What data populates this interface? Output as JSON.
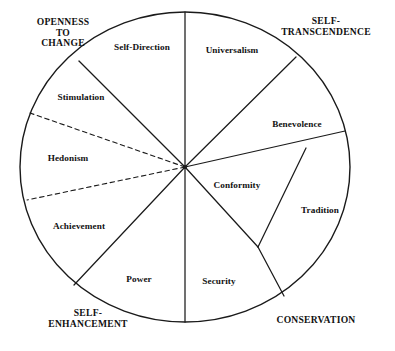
{
  "figure": {
    "background_color": "#ffffff",
    "line_color": "#1a1a1a",
    "text_color": "#111111"
  },
  "circle": {
    "cx": 185,
    "cy": 167,
    "rx": 165,
    "ry": 155,
    "stroke_width": 1.4,
    "fill": "#ffffff"
  },
  "chart_data": {
    "type": "pie",
    "title": "",
    "legend_position": "none",
    "grid": false,
    "note": "Schwartz circumplex of ten basic human values; wedge sizes read off the divider spokes of the circle. Hedonism is bounded by dashed spokes because it straddles two higher-order dimensions.",
    "categories": [
      "Self-Direction",
      "Universalism",
      "Benevolence",
      "Conformity",
      "Tradition",
      "Security",
      "Power",
      "Achievement",
      "Hedonism",
      "Stimulation"
    ],
    "values": [
      44,
      42,
      29,
      25,
      34,
      38,
      37,
      38,
      36,
      37
    ],
    "units": "degrees of arc"
  },
  "values_wedges": [
    {
      "id": "self-direction",
      "label": "Self-Direction",
      "label_x": 142,
      "label_y": 47,
      "start_angle": -90,
      "end_angle": -46,
      "boundary_style": "solid"
    },
    {
      "id": "universalism",
      "label": "Universalism",
      "label_x": 232,
      "label_y": 50,
      "start_angle": -90,
      "end_angle": -48,
      "boundary_style": "solid"
    },
    {
      "id": "benevolence",
      "label": "Benevolence",
      "label_x": 297,
      "label_y": 124,
      "start_angle": -48,
      "end_angle": -19,
      "boundary_style": "solid"
    },
    {
      "id": "conformity",
      "label": "Conformity",
      "label_x": 237,
      "label_y": 185,
      "start_angle": -19,
      "end_angle": 6,
      "boundary_style": "solid"
    },
    {
      "id": "tradition",
      "label": "Tradition",
      "label_x": 320,
      "label_y": 210,
      "start_angle": 6,
      "end_angle": 40,
      "boundary_style": "solid"
    },
    {
      "id": "security",
      "label": "Security",
      "label_x": 219,
      "label_y": 281,
      "start_angle": 40,
      "end_angle": 78,
      "boundary_style": "solid"
    },
    {
      "id": "power",
      "label": "Power",
      "label_x": 139,
      "label_y": 279,
      "start_angle": 78,
      "end_angle": 115,
      "boundary_style": "solid"
    },
    {
      "id": "achievement",
      "label": "Achievement",
      "label_x": 79,
      "label_y": 226,
      "start_angle": 115,
      "end_angle": 153,
      "boundary_style": "solid"
    },
    {
      "id": "hedonism",
      "label": "Hedonism",
      "label_x": 68,
      "label_y": 158,
      "start_angle": 153,
      "end_angle": 189,
      "boundary_style": "dashed"
    },
    {
      "id": "stimulation",
      "label": "Stimulation",
      "label_x": 81,
      "label_y": 97,
      "start_angle": 189,
      "end_angle": 226,
      "boundary_style": "solid"
    }
  ],
  "dimension_labels": [
    {
      "id": "openness-to-change",
      "text": "OPENNESS\nTO\nCHANGE",
      "x": 63,
      "y": 33
    },
    {
      "id": "self-transcendence",
      "text": "SELF-\nTRANSCENDENCE",
      "x": 326,
      "y": 27
    },
    {
      "id": "conservation",
      "text": "CONSERVATION",
      "x": 316,
      "y": 320
    },
    {
      "id": "self-enhancement",
      "text": "SELF-\nENHANCEMENT",
      "x": 88,
      "y": 319
    }
  ],
  "spokes": [
    {
      "id": "spoke-top-vertical",
      "to_x": 185,
      "to_y": 12,
      "style": "solid"
    },
    {
      "id": "spoke-self-direction-stim",
      "to_x": 79,
      "to_y": 61,
      "style": "solid"
    },
    {
      "id": "spoke-stimulation-hedonism",
      "to_x": 30,
      "to_y": 113,
      "style": "dashed"
    },
    {
      "id": "spoke-hedonism-achievement",
      "to_x": 27,
      "to_y": 200,
      "style": "dashed"
    },
    {
      "id": "spoke-achievement-power",
      "to_x": 74,
      "to_y": 285,
      "style": "solid"
    },
    {
      "id": "spoke-power-security",
      "to_x": 185,
      "to_y": 322,
      "style": "solid"
    },
    {
      "id": "spoke-universalism-benev",
      "to_x": 296,
      "to_y": 57,
      "style": "solid"
    },
    {
      "id": "spoke-benevolence-confdiv",
      "to_x": 345,
      "to_y": 131,
      "style": "solid"
    }
  ],
  "fork": {
    "id": "conformity-tradition-fork",
    "junction_x": 258,
    "junction_y": 247,
    "branch_to_rim_x": 306,
    "branch_to_rim_y": 148,
    "branch_to_base_x": 284,
    "branch_to_base_y": 296
  }
}
